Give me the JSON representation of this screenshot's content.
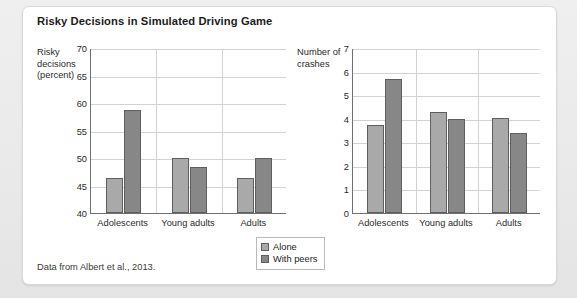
{
  "figure": {
    "title": "Risky Decisions in Simulated Driving Game",
    "source_note": "Data from Albert et al., 2013."
  },
  "legend": {
    "items": [
      {
        "label": "Alone",
        "color": "#a9a9a9"
      },
      {
        "label": "With peers",
        "color": "#878787"
      }
    ]
  },
  "chart_data": [
    {
      "type": "bar",
      "panel": "left",
      "title": "Risky Decisions in Simulated Driving Game",
      "ylabel": "Risky decisions (percent)",
      "xlabel": "",
      "categories": [
        "Adolescents",
        "Young adults",
        "Adults"
      ],
      "ylim": [
        40,
        70
      ],
      "yticks": [
        40,
        45,
        50,
        55,
        60,
        65,
        70
      ],
      "grid": true,
      "legend_position": "bottom-center",
      "series": [
        {
          "name": "Alone",
          "color": "#a9a9a9",
          "values": [
            46.4,
            50.0,
            46.3
          ]
        },
        {
          "name": "With peers",
          "color": "#878787",
          "values": [
            58.7,
            48.4,
            50.0
          ]
        }
      ]
    },
    {
      "type": "bar",
      "panel": "right",
      "title": "",
      "ylabel": "Number of crashes",
      "xlabel": "",
      "categories": [
        "Adolescents",
        "Young adults",
        "Adults"
      ],
      "ylim": [
        0,
        7
      ],
      "yticks": [
        0,
        1,
        2,
        3,
        4,
        5,
        6,
        7
      ],
      "grid": true,
      "legend_position": "bottom-center",
      "series": [
        {
          "name": "Alone",
          "color": "#a9a9a9",
          "values": [
            3.75,
            4.3,
            4.05
          ]
        },
        {
          "name": "With peers",
          "color": "#878787",
          "values": [
            5.7,
            4.0,
            3.4
          ]
        }
      ]
    }
  ]
}
